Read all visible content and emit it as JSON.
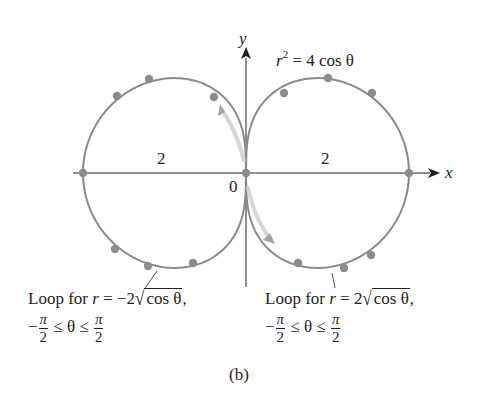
{
  "figure": {
    "caption": "(b)",
    "equation": {
      "lhs_var": "r",
      "lhs_exp": "2",
      "rhs": "= 4 cos θ"
    },
    "axes": {
      "x_label": "x",
      "y_label": "y",
      "origin_label": "0",
      "left_tick_label": "2",
      "right_tick_label": "2"
    },
    "left_loop_label": {
      "line1_prefix": "Loop for ",
      "var": "r",
      "line1_mid": " = −2",
      "sqrt_content": "cos θ",
      "line1_suffix": ",",
      "range_minus": "−",
      "frac_num": "π",
      "frac_den": "2",
      "range_mid": " ≤ θ ≤ "
    },
    "right_loop_label": {
      "line1_prefix": "Loop for ",
      "var": "r",
      "line1_mid": " = 2",
      "sqrt_content": "cos θ",
      "line1_suffix": ",",
      "range_minus": "−",
      "frac_num": "π",
      "frac_den": "2",
      "range_mid": " ≤ θ ≤ "
    },
    "colors": {
      "curve": "#8a8a8a",
      "dots": "#8c8c8c",
      "axis": "#231f20",
      "arrow_highlight": "#c8c8c8"
    },
    "geometry": {
      "origin_px": [
        246,
        173
      ],
      "scale_x_px_per_unit": 81.5,
      "scale_y_px_per_unit": 76.5
    },
    "dots_px": [
      [
        83,
        173
      ],
      [
        246,
        173
      ],
      [
        409,
        173
      ],
      [
        117,
        96
      ],
      [
        149,
        79
      ],
      [
        214,
        97
      ],
      [
        115,
        249
      ],
      [
        148,
        266
      ],
      [
        193,
        263
      ],
      [
        284,
        93
      ],
      [
        328,
        78
      ],
      [
        372,
        93
      ],
      [
        298,
        263
      ],
      [
        344,
        268
      ],
      [
        371,
        255
      ]
    ]
  }
}
